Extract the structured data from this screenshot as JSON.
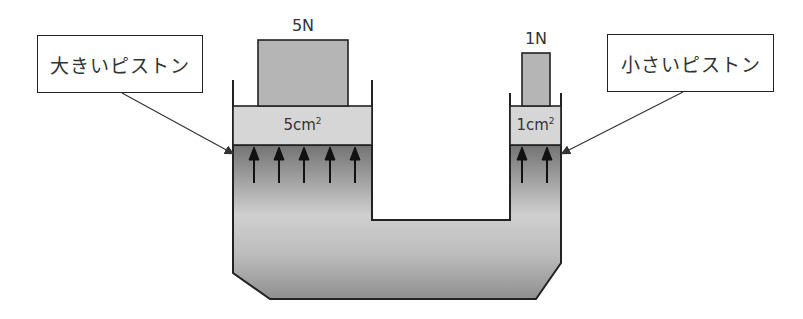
{
  "diagram": {
    "large_piston": {
      "label": "大きいピストン",
      "force": "5N",
      "area_value": "5cm",
      "area_exp": "2",
      "pressure_arrows": 5
    },
    "small_piston": {
      "label": "小さいピストン",
      "force": "1N",
      "area_value": "1cm",
      "area_exp": "2",
      "pressure_arrows": 2
    },
    "colors": {
      "outline": "#222222",
      "weight_fill": "#b5b5b5",
      "piston_fill": "#d6d6d6",
      "fluid_top": "#7a7a7a",
      "fluid_mid": "#c8c8c8",
      "fluid_bottom": "#9a9a9a",
      "arrow": "#111111"
    }
  }
}
